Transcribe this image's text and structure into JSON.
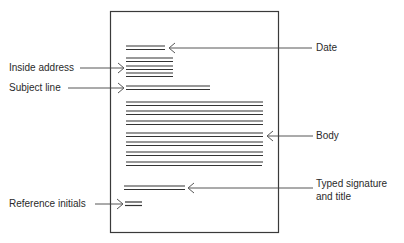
{
  "diagram": {
    "labels": {
      "date": "Date",
      "inside_address": "Inside address",
      "subject_line": "Subject line",
      "body": "Body",
      "signature_line1": "Typed signature",
      "signature_line2": "and title",
      "reference_initials": "Reference initials"
    },
    "colors": {
      "line": "#333333",
      "page_border": "#3a3a3a",
      "background": "#ffffff"
    },
    "page": {
      "x": 110,
      "y": 11,
      "width": 169,
      "height": 222
    }
  }
}
